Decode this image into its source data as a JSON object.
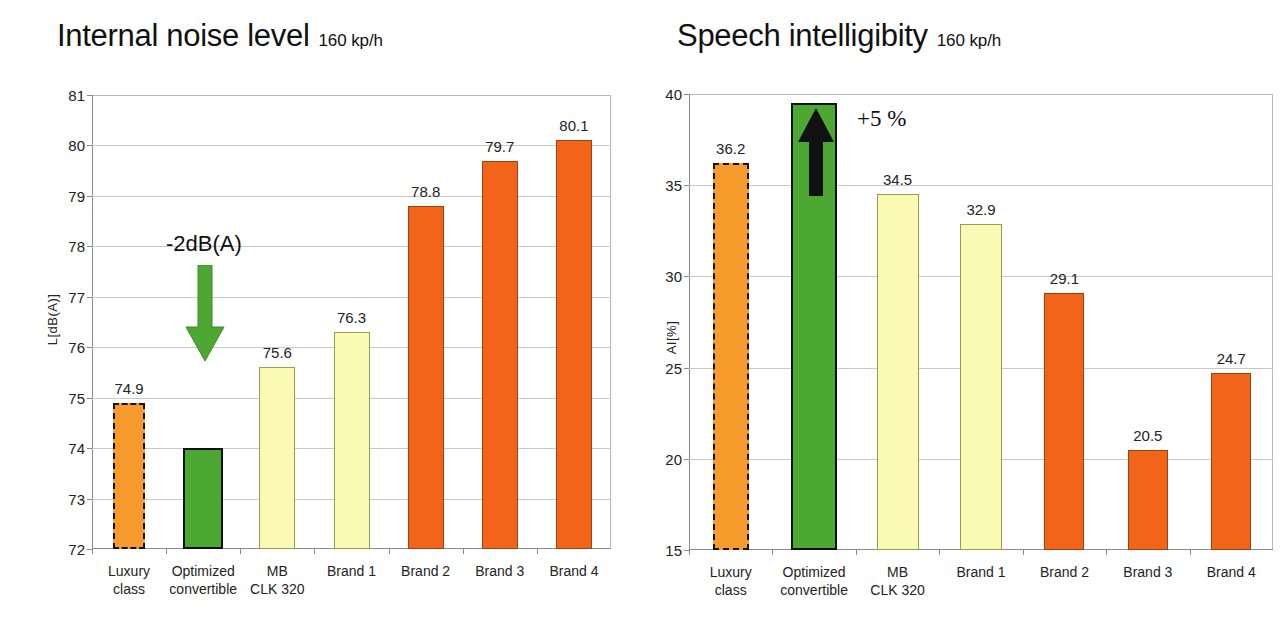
{
  "page": {
    "background": "#ffffff",
    "colors": {
      "orange_highlight": "#F79C2C",
      "green_optimized": "#4CA832",
      "pale_yellow": "#FAFAB4",
      "deep_orange": "#F26419",
      "grid": "#c9c9c9",
      "axis": "#8a8a8a",
      "text": "#1a1a1a"
    }
  },
  "charts": [
    {
      "id": "internal-noise-level",
      "title": "Internal noise level",
      "subtitle": "160 kp/h",
      "ylabel": "L[dB(A)]",
      "annotation": "-2dB(A)",
      "annotation_icon": "arrow-down-icon",
      "annotation_color": "#4CA832"
    },
    {
      "id": "speech-intelligibility",
      "title": "Speech intelligibity",
      "subtitle": "160 kp/h",
      "ylabel": "AI[%]",
      "annotation": "+5 %",
      "annotation_icon": "arrow-up-icon",
      "annotation_color": "#111111"
    }
  ],
  "chart_data": [
    {
      "type": "bar",
      "id": "internal-noise-level",
      "title": "Internal noise level",
      "subtitle": "160 kp/h",
      "xlabel": "",
      "ylabel": "L[dB(A)]",
      "ylim": [
        72,
        81
      ],
      "yticks": [
        72,
        73,
        74,
        75,
        76,
        77,
        78,
        79,
        80,
        81
      ],
      "grid": true,
      "legend": "none",
      "categories": [
        "Luxury\nclass",
        "Optimized\nconvertible",
        "MB\nCLK 320",
        "Brand 1",
        "Brand 2",
        "Brand 3",
        "Brand 4"
      ],
      "values": [
        74.9,
        74.0,
        75.6,
        76.3,
        78.8,
        79.7,
        80.1
      ],
      "value_labels": [
        "74.9",
        "",
        "75.6",
        "76.3",
        "78.8",
        "79.7",
        "80.1"
      ],
      "bar_styles": [
        "orange-dash",
        "green-solid",
        "pale",
        "pale",
        "deep",
        "deep",
        "deep"
      ],
      "annotations": [
        {
          "text": "-2dB(A)",
          "icon": "arrow-down-icon",
          "color": "#4CA832",
          "from_value": 75.6,
          "to_value": 74.0
        }
      ]
    },
    {
      "type": "bar",
      "id": "speech-intelligibility",
      "title": "Speech intelligibity",
      "subtitle": "160 kp/h",
      "xlabel": "",
      "ylabel": "AI[%]",
      "ylim": [
        15,
        40
      ],
      "yticks": [
        15,
        20,
        25,
        30,
        35,
        40
      ],
      "grid": true,
      "legend": "none",
      "categories": [
        "Luxury\nclass",
        "Optimized\nconvertible",
        "MB\nCLK 320",
        "Brand 1",
        "Brand 2",
        "Brand 3",
        "Brand 4"
      ],
      "values": [
        36.2,
        39.5,
        34.5,
        32.9,
        29.1,
        20.5,
        24.7
      ],
      "value_labels": [
        "36.2",
        "",
        "34.5",
        "32.9",
        "29.1",
        "20.5",
        "24.7"
      ],
      "bar_styles": [
        "orange-dash",
        "green-solid",
        "pale",
        "pale",
        "deep",
        "deep",
        "deep"
      ],
      "annotations": [
        {
          "text": "+5 %",
          "icon": "arrow-up-icon",
          "color": "#111111",
          "from_value": 34.5,
          "to_value": 39.5
        }
      ]
    }
  ],
  "yticks_left": [
    "81",
    "80",
    "79",
    "78",
    "77",
    "76",
    "75",
    "74",
    "73",
    "72"
  ],
  "yticks_right": [
    "40",
    "35",
    "30",
    "25",
    "20",
    "15"
  ],
  "categories_display": [
    "Luxury\nclass",
    "Optimized\nconvertible",
    "MB\nCLK 320",
    "Brand 1",
    "Brand 2",
    "Brand 3",
    "Brand 4"
  ]
}
